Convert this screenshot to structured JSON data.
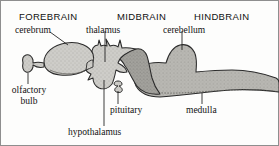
{
  "figure": {
    "title_regions": [
      {
        "id": "forebrain",
        "label": "FOREBRAIN"
      },
      {
        "id": "midbrain",
        "label": "MIDBRAIN"
      },
      {
        "id": "hindbrain",
        "label": "HINDBRAIN"
      }
    ],
    "labels": [
      {
        "id": "cerebrum",
        "label": "cerebrum"
      },
      {
        "id": "thalamus",
        "label": "thalamus"
      },
      {
        "id": "cerebellum",
        "label": "cerebellum"
      },
      {
        "id": "olfactory",
        "label": "olfactory\nbulb",
        "line1": "olfactory",
        "line2": "bulb"
      },
      {
        "id": "pituitary",
        "label": "pituitary"
      },
      {
        "id": "hypothalamus",
        "label": "hypothalamus"
      },
      {
        "id": "medulla",
        "label": "medulla"
      }
    ],
    "colors": {
      "outline": "#2b2b2b",
      "light_gray": "#c9c8c4",
      "mid_gray": "#a8a7a3",
      "dark_gray": "#8d8c88",
      "border": "#8e8e8e",
      "text": "#111111",
      "leader": "#1a1a1a"
    },
    "caption_note": "Lateral view of vertebrate brain divided into forebrain, midbrain and hindbrain regions."
  }
}
